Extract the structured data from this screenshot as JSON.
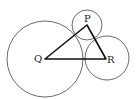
{
  "diagram": {
    "type": "geometry",
    "labels": {
      "P": "P",
      "Q": "Q",
      "R": "R"
    },
    "points": {
      "P": [
        87,
        25
      ],
      "Q": [
        45,
        59
      ],
      "R": [
        106,
        59
      ]
    },
    "circles": [
      {
        "center": "Q",
        "r": 38
      },
      {
        "center": "P",
        "r": 15
      },
      {
        "center": "R",
        "r": 22
      }
    ],
    "colors": {
      "stroke": "#333333",
      "triangle": "#111111"
    }
  }
}
